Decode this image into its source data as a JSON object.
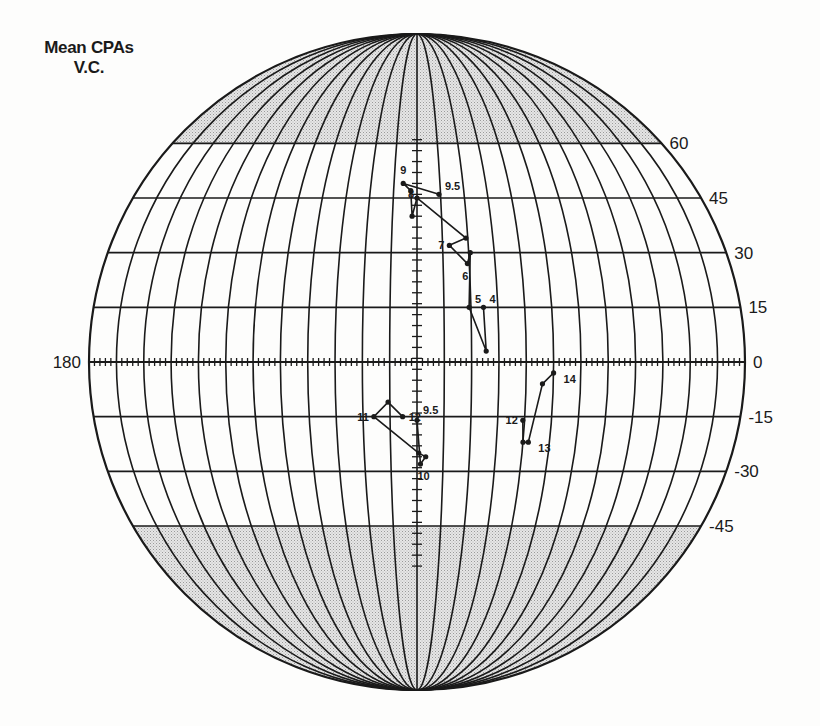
{
  "title": {
    "line1": "Mean CPAs",
    "line2": "V.C."
  },
  "chart_data": {
    "type": "scatter",
    "projection": "globe (equidistant latitude, elliptical meridians)",
    "title": "Mean CPAs V.C.",
    "xlabel": "Longitude",
    "ylabel": "Latitude",
    "left_label": "180",
    "lat_ticks": [
      60,
      45,
      30,
      15,
      0,
      -15,
      -30,
      -45
    ],
    "lat_tick_labels": [
      "60",
      "45",
      "30",
      "15",
      "0",
      "-15",
      "-30",
      "-45"
    ],
    "meridian_step_deg": 15,
    "shaded_regions": [
      "lat > 60",
      "lat < -45"
    ],
    "grid": true,
    "series": [
      {
        "name": "Northern track",
        "points": [
          {
            "label": "4",
            "lon": 37,
            "lat": 15
          },
          {
            "label": "",
            "lon": 38,
            "lat": 3
          },
          {
            "label": "5",
            "lon": 29,
            "lat": 15
          },
          {
            "label": "",
            "lon": 31,
            "lat": 30
          },
          {
            "label": "6",
            "lon": 29,
            "lat": 27
          },
          {
            "label": "7",
            "lon": 19,
            "lat": 32
          },
          {
            "label": "",
            "lon": 29,
            "lat": 34
          },
          {
            "label": "8",
            "lon": 0,
            "lat": 45
          },
          {
            "label": "",
            "lon": -3,
            "lat": 40
          },
          {
            "label": "",
            "lon": -4,
            "lat": 47
          },
          {
            "label": "9",
            "lon": -9,
            "lat": 49
          },
          {
            "label": "9.5",
            "lon": 14,
            "lat": 46
          }
        ]
      },
      {
        "name": "Southern track (centre)",
        "points": [
          {
            "label": "12",
            "lon": -8,
            "lat": -15
          },
          {
            "label": "",
            "lon": -16,
            "lat": -11
          },
          {
            "label": "11",
            "lon": -24,
            "lat": -15
          },
          {
            "label": "",
            "lon": 1,
            "lat": -25
          },
          {
            "label": "",
            "lon": 5,
            "lat": -26
          },
          {
            "label": "10",
            "lon": 2,
            "lat": -28
          },
          {
            "label": "9.5",
            "lon": 0,
            "lat": -16
          }
        ]
      },
      {
        "name": "Southern track (east)",
        "points": [
          {
            "label": "12",
            "lon": 59,
            "lat": -16
          },
          {
            "label": "",
            "lon": 60,
            "lat": -22
          },
          {
            "label": "13",
            "lon": 63,
            "lat": -22
          },
          {
            "label": "",
            "lon": 69,
            "lat": -6
          },
          {
            "label": "14",
            "lon": 75,
            "lat": -3
          }
        ]
      }
    ]
  },
  "geom": {
    "cx": 417,
    "cy": 362,
    "rx": 328,
    "ry": 328
  }
}
